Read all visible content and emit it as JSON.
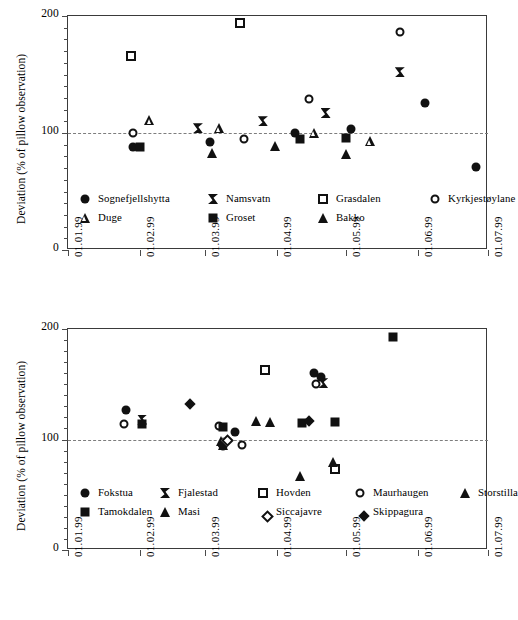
{
  "figure": {
    "background": "#ffffff",
    "ink_color": "#111111",
    "axis_color": "#3a3a3a",
    "reference_line_color": "#7d7d7d"
  },
  "charts": [
    {
      "id": "top",
      "chart_data": {
        "type": "scatter",
        "title": "",
        "xlabel": "",
        "ylabel": "Deviation (% of pillow observation)",
        "ylim": [
          0,
          200
        ],
        "yticks": [
          0,
          100,
          200
        ],
        "ytick_labels": [
          "0",
          "100",
          "200"
        ],
        "y_minor_tick_step": 10,
        "xlim": [
          "01.01.99",
          "01.07.99"
        ],
        "xticks": [
          "01.01.99",
          "01.02.99",
          "01.03.99",
          "01.04.99",
          "01.05.99",
          "01.06.99",
          "01.07.99"
        ],
        "grid": false,
        "reference_line_y": 100,
        "legend_position": "inside-bottom",
        "series": [
          {
            "name": "Sognefjellshytta",
            "marker": "circle-filled",
            "points": [
              {
                "x": "29.01.99",
                "y": 88
              },
              {
                "x": "03.03.99",
                "y": 92
              },
              {
                "x": "09.04.99",
                "y": 100
              },
              {
                "x": "03.05.99",
                "y": 103
              },
              {
                "x": "04.06.99",
                "y": 126
              },
              {
                "x": "26.06.99",
                "y": 71
              }
            ]
          },
          {
            "name": "Namsvatn",
            "marker": "bowtie",
            "points": [
              {
                "x": "26.02.99",
                "y": 104
              },
              {
                "x": "26.03.99",
                "y": 110
              },
              {
                "x": "22.04.99",
                "y": 117
              },
              {
                "x": "24.05.99",
                "y": 152
              }
            ]
          },
          {
            "name": "Grasdalen",
            "marker": "square-open",
            "points": [
              {
                "x": "28.01.99",
                "y": 166
              },
              {
                "x": "16.03.99",
                "y": 194
              }
            ]
          },
          {
            "name": "Kyrkjestøylane",
            "marker": "circle-open",
            "points": [
              {
                "x": "29.01.99",
                "y": 100
              },
              {
                "x": "18.03.99",
                "y": 95
              },
              {
                "x": "15.04.99",
                "y": 129
              },
              {
                "x": "24.05.99",
                "y": 186
              }
            ]
          },
          {
            "name": "Duge",
            "marker": "triangle-open",
            "points": [
              {
                "x": "05.02.99",
                "y": 111
              },
              {
                "x": "07.03.99",
                "y": 104
              },
              {
                "x": "17.04.99",
                "y": 100
              },
              {
                "x": "11.05.99",
                "y": 93
              }
            ]
          },
          {
            "name": "Groset",
            "marker": "square-filled",
            "points": [
              {
                "x": "01.02.99",
                "y": 88
              },
              {
                "x": "11.04.99",
                "y": 95
              },
              {
                "x": "01.05.99",
                "y": 96
              }
            ]
          },
          {
            "name": "Bakko",
            "marker": "triangle-filled",
            "points": [
              {
                "x": "04.03.99",
                "y": 83
              },
              {
                "x": "31.03.99",
                "y": 89
              },
              {
                "x": "01.05.99",
                "y": 82
              }
            ]
          }
        ]
      },
      "legend": {
        "rows": [
          [
            {
              "label": "Sognefjellshytta",
              "marker": "circle-filled"
            },
            {
              "label": "Namsvatn",
              "marker": "bowtie"
            },
            {
              "label": "Grasdalen",
              "marker": "square-open"
            },
            {
              "label": "Kyrkjestøylane",
              "marker": "circle-open"
            }
          ],
          [
            {
              "label": "Duge",
              "marker": "triangle-open"
            },
            {
              "label": "Groset",
              "marker": "square-filled"
            },
            {
              "label": "Bakko",
              "marker": "triangle-filled"
            }
          ]
        ]
      }
    },
    {
      "id": "bottom",
      "chart_data": {
        "type": "scatter",
        "title": "",
        "xlabel": "",
        "ylabel": "Deviation (% of pillow observation)",
        "ylim": [
          0,
          200
        ],
        "yticks": [
          0,
          100,
          200
        ],
        "ytick_labels": [
          "0",
          "100",
          "200"
        ],
        "y_minor_tick_step": 10,
        "xlim": [
          "01.01.99",
          "01.07.99"
        ],
        "xticks": [
          "01.01.99",
          "01.02.99",
          "01.03.99",
          "01.04.99",
          "01.05.99",
          "01.06.99",
          "01.07.99"
        ],
        "grid": false,
        "reference_line_y": 100,
        "legend_position": "inside-bottom",
        "series": [
          {
            "name": "Fokstua",
            "marker": "circle-filled",
            "points": [
              {
                "x": "26.01.99",
                "y": 127
              },
              {
                "x": "14.03.99",
                "y": 107
              },
              {
                "x": "17.04.99",
                "y": 160
              },
              {
                "x": "20.04.99",
                "y": 157
              }
            ]
          },
          {
            "name": "Fjalestad",
            "marker": "bowtie",
            "points": [
              {
                "x": "02.02.99",
                "y": 118
              },
              {
                "x": "21.04.99",
                "y": 151
              }
            ]
          },
          {
            "name": "Hovden",
            "marker": "square-open",
            "points": [
              {
                "x": "27.03.99",
                "y": 163
              },
              {
                "x": "26.04.99",
                "y": 73
              }
            ]
          },
          {
            "name": "Maurhaugen",
            "marker": "circle-open",
            "points": [
              {
                "x": "25.01.99",
                "y": 114
              },
              {
                "x": "07.03.99",
                "y": 112
              },
              {
                "x": "09.03.99",
                "y": 94
              },
              {
                "x": "17.03.99",
                "y": 95
              },
              {
                "x": "18.04.99",
                "y": 150
              }
            ]
          },
          {
            "name": "Storstilla",
            "marker": "triangle-filled",
            "points": [
              {
                "x": "08.03.99",
                "y": 99
              },
              {
                "x": "09.03.99",
                "y": 95
              },
              {
                "x": "29.03.99",
                "y": 116
              },
              {
                "x": "11.04.99",
                "y": 67
              },
              {
                "x": "25.04.99",
                "y": 80
              }
            ]
          },
          {
            "name": "Tamokdalen",
            "marker": "square-filled",
            "points": [
              {
                "x": "02.02.99",
                "y": 114
              },
              {
                "x": "09.03.99",
                "y": 111
              },
              {
                "x": "12.04.99",
                "y": 115
              },
              {
                "x": "26.04.99",
                "y": 116
              },
              {
                "x": "21.05.99",
                "y": 193
              }
            ]
          },
          {
            "name": "Masi",
            "marker": "triangle-filled",
            "points": [
              {
                "x": "09.03.99",
                "y": 98
              },
              {
                "x": "23.03.99",
                "y": 117
              }
            ]
          },
          {
            "name": "Siccajavre",
            "marker": "diamond-open",
            "points": [
              {
                "x": "09.03.99",
                "y": 103
              }
            ]
          },
          {
            "name": "Skippagura",
            "marker": "diamond-filled",
            "points": [
              {
                "x": "21.02.99",
                "y": 136
              },
              {
                "x": "13.04.99",
                "y": 120
              }
            ]
          }
        ]
      },
      "legend": {
        "rows": [
          [
            {
              "label": "Fokstua",
              "marker": "circle-filled"
            },
            {
              "label": "Fjalestad",
              "marker": "bowtie"
            },
            {
              "label": "Hovden",
              "marker": "square-open"
            },
            {
              "label": "Maurhaugen",
              "marker": "circle-open"
            },
            {
              "label": "Storstilla",
              "marker": "triangle-filled"
            }
          ],
          [
            {
              "label": "Tamokdalen",
              "marker": "square-filled"
            },
            {
              "label": "Masi",
              "marker": "triangle-filled"
            },
            {
              "label": "Siccajavre",
              "marker": "diamond-open"
            },
            {
              "label": "Skippagura",
              "marker": "diamond-filled"
            }
          ]
        ]
      }
    }
  ]
}
